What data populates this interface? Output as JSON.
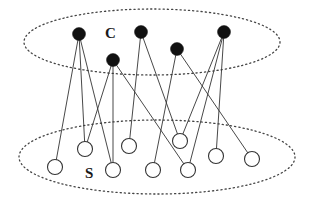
{
  "diagram": {
    "type": "bipartite-graph",
    "colors": {
      "edge": "#333333",
      "filled_node": "#111111",
      "open_node_stroke": "#333333",
      "open_node_fill": "#ffffff",
      "ellipse_stroke": "#444444"
    },
    "sets": [
      {
        "id": "C",
        "label": "C",
        "label_pos": {
          "x": 105,
          "y": 38
        },
        "ellipse": {
          "cx": 152,
          "cy": 42,
          "rx": 128,
          "ry": 33
        },
        "node_style": "filled"
      },
      {
        "id": "S",
        "label": "S",
        "label_pos": {
          "x": 85,
          "y": 178
        },
        "ellipse": {
          "cx": 157,
          "cy": 157,
          "rx": 138,
          "ry": 37
        },
        "node_style": "open"
      }
    ],
    "nodes": {
      "C": [
        {
          "id": "c1",
          "x": 79,
          "y": 34
        },
        {
          "id": "c2",
          "x": 113,
          "y": 60
        },
        {
          "id": "c3",
          "x": 141,
          "y": 32
        },
        {
          "id": "c4",
          "x": 177,
          "y": 49
        },
        {
          "id": "c5",
          "x": 224,
          "y": 32
        }
      ],
      "S": [
        {
          "id": "s1",
          "x": 55,
          "y": 167
        },
        {
          "id": "s2",
          "x": 85,
          "y": 149
        },
        {
          "id": "s3",
          "x": 113,
          "y": 170
        },
        {
          "id": "s4",
          "x": 129,
          "y": 146
        },
        {
          "id": "s5",
          "x": 153,
          "y": 170
        },
        {
          "id": "s6",
          "x": 180,
          "y": 141
        },
        {
          "id": "s7",
          "x": 188,
          "y": 170
        },
        {
          "id": "s8",
          "x": 216,
          "y": 156
        },
        {
          "id": "s9",
          "x": 252,
          "y": 159
        }
      ]
    },
    "node_radius": {
      "filled": 6.5,
      "open": 7.5
    },
    "edges": [
      [
        "c1",
        "s1"
      ],
      [
        "c1",
        "s2"
      ],
      [
        "c1",
        "s3"
      ],
      [
        "c2",
        "s2"
      ],
      [
        "c2",
        "s3"
      ],
      [
        "c2",
        "s7"
      ],
      [
        "c3",
        "s4"
      ],
      [
        "c3",
        "s6"
      ],
      [
        "c4",
        "s5"
      ],
      [
        "c4",
        "s9"
      ],
      [
        "c5",
        "s6"
      ],
      [
        "c5",
        "s7"
      ],
      [
        "c5",
        "s8"
      ]
    ]
  }
}
